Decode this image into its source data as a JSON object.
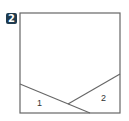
{
  "badge": {
    "label": "2",
    "color": "#1f3b4f"
  },
  "figure": {
    "stroke_color": "#666666",
    "square": {
      "x": 20,
      "y": 13,
      "width": 100,
      "height": 100
    },
    "lines": [
      {
        "name": "line-1",
        "x1": 20,
        "y1": 84,
        "x2": 90,
        "y2": 113
      },
      {
        "name": "line-2",
        "x1": 68,
        "y1": 104,
        "x2": 120,
        "y2": 74
      }
    ],
    "regions": [
      {
        "label": "1",
        "x": 37,
        "y": 106
      },
      {
        "label": "2",
        "x": 101,
        "y": 101
      }
    ]
  }
}
